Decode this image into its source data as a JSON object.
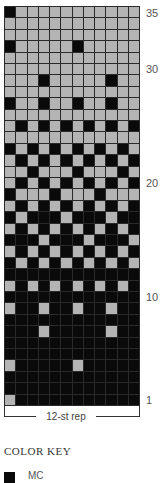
{
  "chart_data": {
    "type": "heatmap",
    "columns": 12,
    "rows": 35,
    "legend": [
      {
        "name": "MC",
        "color": "#0a0a0a"
      },
      {
        "name": "CC",
        "color": "#b4b4b4"
      }
    ],
    "row_labels": {
      "1": "1",
      "10": "10",
      "20": "20",
      "30": "30",
      "35": "35"
    },
    "repeat_label": "12-st rep",
    "grid_rows_top_to_bottom": [
      {
        "row": 35,
        "mc_cols": [
          1
        ]
      },
      {
        "row": 34,
        "mc_cols": []
      },
      {
        "row": 33,
        "mc_cols": []
      },
      {
        "row": 32,
        "mc_cols": [
          1,
          7
        ]
      },
      {
        "row": 31,
        "mc_cols": []
      },
      {
        "row": 30,
        "mc_cols": []
      },
      {
        "row": 29,
        "mc_cols": [
          4,
          10
        ]
      },
      {
        "row": 28,
        "mc_cols": []
      },
      {
        "row": 27,
        "mc_cols": [
          1,
          4,
          7,
          10
        ]
      },
      {
        "row": 26,
        "mc_cols": []
      },
      {
        "row": 25,
        "mc_cols": [
          2,
          4,
          6,
          8,
          10,
          12
        ]
      },
      {
        "row": 24,
        "mc_cols": []
      },
      {
        "row": 23,
        "mc_cols": [
          1,
          3,
          5,
          7,
          9,
          11
        ]
      },
      {
        "row": 22,
        "mc_cols": [
          2,
          4,
          6,
          8,
          10,
          12
        ]
      },
      {
        "row": 21,
        "mc_cols": [
          3,
          7,
          11
        ]
      },
      {
        "row": 20,
        "mc_cols": [
          2,
          4,
          6,
          8,
          10,
          12
        ]
      },
      {
        "row": 19,
        "mc_cols": [
          1,
          5,
          9
        ]
      },
      {
        "row": 18,
        "mc_cols": [
          2,
          4,
          6,
          8,
          10,
          12
        ]
      },
      {
        "row": 17,
        "mc_cols": [
          1,
          3,
          4,
          5,
          7,
          8,
          9,
          11,
          12
        ]
      },
      {
        "row": 16,
        "mc_cols": [
          2,
          4,
          6,
          8,
          10,
          12
        ]
      },
      {
        "row": 15,
        "mc_cols": [
          1,
          2,
          3,
          5,
          6,
          7,
          9,
          10,
          11
        ]
      },
      {
        "row": 14,
        "mc_cols": [
          2,
          4,
          6,
          8,
          10,
          12
        ]
      },
      {
        "row": 13,
        "mc_cols": [
          1,
          3,
          5,
          7,
          9,
          11
        ]
      },
      {
        "row": 12,
        "mc_cols": [
          1,
          2,
          3,
          4,
          5,
          6,
          7,
          8,
          9,
          10,
          11,
          12
        ]
      },
      {
        "row": 11,
        "mc_cols": [
          2,
          4,
          6,
          8,
          10,
          12
        ]
      },
      {
        "row": 10,
        "mc_cols": [
          1,
          2,
          3,
          4,
          5,
          6,
          7,
          8,
          9,
          10,
          11,
          12
        ]
      },
      {
        "row": 9,
        "mc_cols": [
          2,
          3,
          5,
          6,
          8,
          9,
          11,
          12
        ]
      },
      {
        "row": 8,
        "mc_cols": [
          1,
          2,
          3,
          4,
          5,
          6,
          7,
          8,
          9,
          10,
          11,
          12
        ]
      },
      {
        "row": 7,
        "mc_cols": [
          1,
          2,
          3,
          5,
          6,
          7,
          8,
          9,
          11,
          12
        ]
      },
      {
        "row": 6,
        "mc_cols": [
          1,
          2,
          3,
          4,
          5,
          6,
          7,
          8,
          9,
          10,
          11,
          12
        ]
      },
      {
        "row": 5,
        "mc_cols": [
          1,
          2,
          3,
          4,
          5,
          6,
          7,
          8,
          9,
          10,
          11,
          12
        ]
      },
      {
        "row": 4,
        "mc_cols": [
          2,
          3,
          4,
          5,
          6,
          8,
          9,
          10,
          11,
          12
        ]
      },
      {
        "row": 3,
        "mc_cols": [
          1,
          2,
          3,
          4,
          5,
          6,
          7,
          8,
          9,
          10,
          11,
          12
        ]
      },
      {
        "row": 2,
        "mc_cols": [
          1,
          2,
          3,
          4,
          5,
          6,
          7,
          8,
          9,
          10,
          11,
          12
        ]
      },
      {
        "row": 1,
        "mc_cols": [
          2,
          3,
          4,
          5,
          6,
          7,
          8,
          9,
          10,
          11,
          12
        ]
      }
    ]
  },
  "labels": {
    "r35": "35",
    "r30": "30",
    "r20": "20",
    "r10": "10",
    "r1": "1"
  },
  "repeat": {
    "label": "12-st rep"
  },
  "key": {
    "title": "COLOR KEY",
    "items": [
      {
        "label": "MC",
        "color": "#0a0a0a"
      }
    ]
  }
}
